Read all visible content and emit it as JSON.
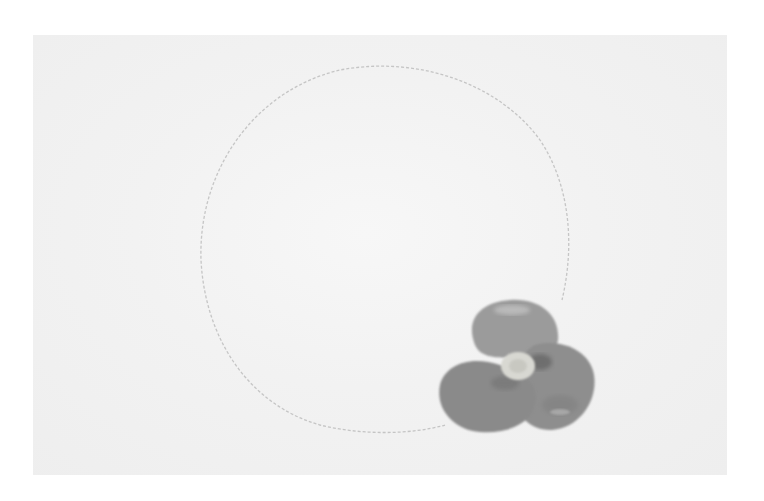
{
  "image": {
    "description": "Watercolor painting of a single grey-toned pansy-like flower with a pale yellowish center, positioned at the lower right of a faint dashed pencil-drawn circle on off-white paper",
    "subject": "flower",
    "colors": {
      "background": "#ffffff",
      "paper": "#f1f1f1",
      "pencil_circle": "#bdbdbd",
      "petal_light": "#9a9a9a",
      "petal_dark": "#6e6e6e",
      "center": "#d6d6d0"
    }
  }
}
